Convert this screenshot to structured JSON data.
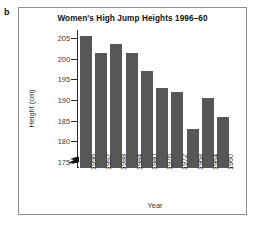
{
  "panel": {
    "label": "b"
  },
  "chart_data": {
    "type": "bar",
    "title": "Women's High Jump Heights 1996–60",
    "xlabel": "Year",
    "ylabel": "Height (cm)",
    "categories": [
      "1996",
      "1992",
      "1988",
      "1984",
      "1980",
      "1976",
      "1972",
      "1968",
      "1964",
      "1960"
    ],
    "values": [
      205.6,
      201.5,
      203.5,
      201.5,
      197.0,
      193.0,
      192.0,
      183.0,
      190.5,
      186.0
    ],
    "ylim": [
      173.5,
      207
    ],
    "yticks": [
      175,
      180,
      185,
      190,
      195,
      200,
      205
    ],
    "ytick_labels": [
      "175",
      "180",
      "185",
      "190",
      "195",
      "200",
      "205"
    ],
    "grid": false,
    "legend": "none",
    "axis_break": true,
    "bar_color": "#575757",
    "axis_color": "#2a2a2a",
    "frame_color": "#8d8d8d",
    "background": "#ffffff"
  }
}
